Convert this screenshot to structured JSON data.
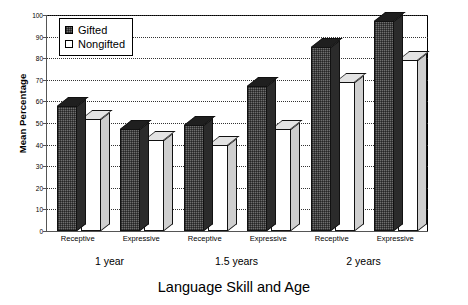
{
  "chart_data": {
    "type": "bar",
    "title": "",
    "xlabel": "Language Skill and Age",
    "ylabel": "Mean Percentage",
    "ylim": [
      0,
      100
    ],
    "ytick_step": 10,
    "yticks": [
      0,
      10,
      20,
      30,
      40,
      50,
      60,
      70,
      80,
      90,
      100
    ],
    "grid": true,
    "grid_axis": "y",
    "legend_position": "top-left",
    "categories": [
      "Receptive",
      "Expressive",
      "Receptive",
      "Expressive",
      "Receptive",
      "Expressive"
    ],
    "groups": [
      {
        "label": "1 year",
        "categories": [
          "Receptive",
          "Expressive"
        ]
      },
      {
        "label": "1.5 years",
        "categories": [
          "Receptive",
          "Expressive"
        ]
      },
      {
        "label": "2 years",
        "categories": [
          "Receptive",
          "Expressive"
        ]
      }
    ],
    "series": [
      {
        "name": "Gifted",
        "values": [
          58,
          47,
          49,
          67,
          85,
          97
        ],
        "color": "#6e6e6e"
      },
      {
        "name": "Nongifted",
        "values": [
          52,
          42,
          40,
          47,
          69,
          79
        ],
        "color": "#ffffff"
      }
    ]
  },
  "legend": {
    "items": [
      {
        "label": "Gifted",
        "style": "gifted"
      },
      {
        "label": "Nongifted",
        "style": "nongifted"
      }
    ]
  },
  "axes": {
    "y_title": "Mean Percentage",
    "x_title": "Language Skill and Age",
    "y_tick_labels": [
      "0",
      "10",
      "20",
      "30",
      "40",
      "50",
      "60",
      "70",
      "80",
      "90",
      "100"
    ]
  }
}
